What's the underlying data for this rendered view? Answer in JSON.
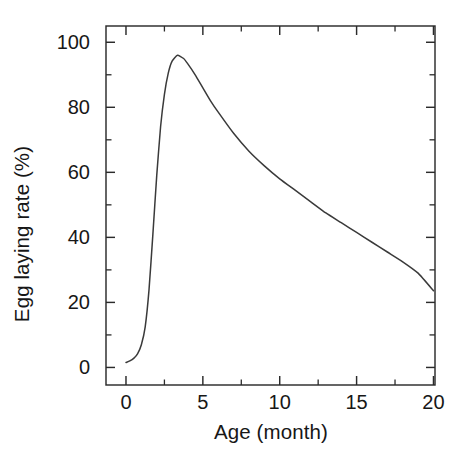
{
  "figure": {
    "width": 474,
    "height": 468,
    "background": "#ffffff",
    "line_color": "#3a3a3a",
    "axis_color": "#2b2b2b",
    "text_color": "#171717"
  },
  "chart_data": {
    "type": "line",
    "title": "",
    "xlabel": "Age (month)",
    "ylabel": "Egg laying rate (%)",
    "xlim": [
      -1.3,
      20.1
    ],
    "ylim": [
      -5.4,
      105.0
    ],
    "grid": false,
    "legend": false,
    "legend_position": "none",
    "x_major_ticks": [
      0,
      5,
      10,
      15,
      20
    ],
    "x_tick_labels": [
      "0",
      "5",
      "10",
      "15",
      "20"
    ],
    "x_minor_ticks": [
      2.5,
      7.5,
      12.5,
      17.5
    ],
    "y_major_ticks": [
      0,
      20,
      40,
      60,
      80,
      100
    ],
    "y_tick_labels": [
      "0",
      "20",
      "40",
      "60",
      "80",
      "100"
    ],
    "y_minor_ticks": [
      10,
      30,
      50,
      70,
      90
    ],
    "tick_direction": "in",
    "frame_sides": [
      "left",
      "right",
      "top",
      "bottom"
    ],
    "series": [
      {
        "name": "Egg laying rate",
        "x": [
          0.0,
          0.25,
          0.5,
          0.75,
          1.0,
          1.25,
          1.5,
          1.75,
          2.0,
          2.25,
          2.5,
          2.75,
          3.0,
          3.35,
          3.75,
          4.0,
          4.5,
          5.0,
          5.5,
          6.0,
          7.0,
          8.0,
          9.0,
          10.0,
          11.0,
          12.0,
          13.0,
          14.0,
          15.0,
          16.0,
          17.0,
          18.0,
          19.0,
          20.0
        ],
        "y": [
          1.5,
          2.0,
          2.8,
          4.2,
          7.0,
          12.5,
          24.0,
          41.0,
          59.0,
          74.0,
          84.0,
          90.5,
          94.2,
          96.0,
          95.0,
          93.5,
          90.0,
          86.0,
          82.0,
          78.5,
          72.0,
          66.5,
          62.0,
          58.0,
          54.5,
          51.0,
          47.5,
          44.5,
          41.5,
          38.5,
          35.5,
          32.5,
          29.0,
          23.6
        ]
      }
    ],
    "annotations": []
  }
}
